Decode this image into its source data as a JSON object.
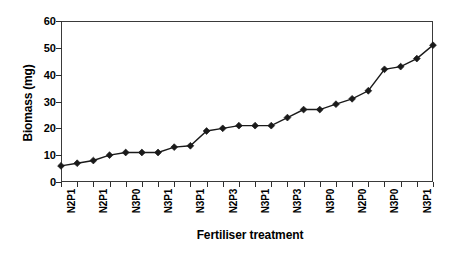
{
  "chart_data": {
    "type": "line",
    "title": "",
    "xlabel": "Fertiliser treatment",
    "ylabel": "Biomass (mg)",
    "ylim": [
      0,
      60
    ],
    "ytick_values": [
      0,
      10,
      20,
      30,
      40,
      50,
      60
    ],
    "grid": false,
    "legend": "none",
    "marker": "filled-diamond",
    "line_color": "#1a1a1a",
    "marker_color": "#1a1a1a",
    "n_points": 24,
    "x_indices": [
      1,
      2,
      3,
      4,
      5,
      6,
      7,
      8,
      9,
      10,
      11,
      12,
      13,
      14,
      15,
      16,
      17,
      18,
      19,
      20,
      21,
      22,
      23,
      24
    ],
    "categories": [
      "N2P1",
      "",
      "N2P1",
      "",
      "N3P0",
      "",
      "N3P1",
      "",
      "N3P1",
      "",
      "N2P3",
      "",
      "N3P1",
      "",
      "N3P3",
      "",
      "N3P0",
      "",
      "N2P0",
      "",
      "N3P0",
      "",
      "N3P1",
      ""
    ],
    "visible_tick_labels": [
      "N2P1",
      "N2P1",
      "N3P0",
      "N3P1",
      "N3P1",
      "N2P3",
      "N3P1",
      "N3P3",
      "N3P0",
      "N2P0",
      "N3P0",
      "N3P1"
    ],
    "values": [
      6,
      7,
      8,
      10,
      11,
      11,
      11,
      13,
      13.5,
      19,
      20,
      21,
      21,
      21,
      24,
      27,
      27,
      29,
      31,
      34,
      42,
      43,
      46,
      51
    ],
    "series": [
      {
        "name": "Biomass",
        "values": [
          6,
          7,
          8,
          10,
          11,
          11,
          11,
          13,
          13.5,
          19,
          20,
          21,
          21,
          21,
          24,
          27,
          27,
          29,
          31,
          34,
          42,
          43,
          46,
          51
        ]
      }
    ]
  }
}
